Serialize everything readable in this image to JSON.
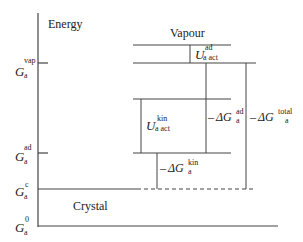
{
  "axis": {
    "title": "Energy",
    "levels": [
      {
        "symbol": "G",
        "sub": "a",
        "sup": "vap"
      },
      {
        "symbol": "G",
        "sub": "a",
        "sup": "ad"
      },
      {
        "symbol": "G",
        "sub": "a",
        "sup": "c"
      },
      {
        "symbol": "G",
        "sub": "a",
        "sup": "0"
      }
    ]
  },
  "regions": {
    "vapour": "Vapour",
    "crystal": "Crystal"
  },
  "arrows": {
    "u_ad": {
      "symbol": "U",
      "sup": "ad",
      "sub": "a act"
    },
    "u_kin": {
      "symbol": "U",
      "sup": "kin",
      "sub": "a act"
    },
    "dg_ad": {
      "prefix": "–",
      "symbol": "ΔG",
      "sup": "ad",
      "sub": "a"
    },
    "dg_kin": {
      "prefix": "–",
      "symbol": "ΔG",
      "sup": "kin",
      "sub": "a"
    },
    "dg_total": {
      "prefix": "–",
      "symbol": "ΔG",
      "sup": "total",
      "sub": "a"
    }
  },
  "colors": {
    "line": "#333333",
    "text": "#222222"
  }
}
